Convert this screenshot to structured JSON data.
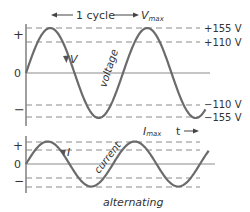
{
  "diagram": {
    "title": "alternating",
    "colors": {
      "wave": "#6b6b6b",
      "axis": "#6b6b6b",
      "dashed": "#8a8a8a",
      "text": "#333333"
    },
    "voltage_panel": {
      "cycle_label": "1 cycle",
      "vmax_label": "V",
      "vmax_subscript": "max",
      "wave_label": "voltage",
      "arrow_label": "V",
      "axis_plus": "+",
      "axis_zero": "0",
      "axis_minus": "−",
      "levels": [
        {
          "label": "+155 V",
          "value": 155
        },
        {
          "label": "+110 V",
          "value": 110
        },
        {
          "label": "−110 V",
          "value": -110
        },
        {
          "label": "−155 V",
          "value": -155
        }
      ],
      "peak": 155,
      "cycles_shown": 1.85
    },
    "current_panel": {
      "imax_label": "I",
      "imax_subscript": "max",
      "time_label": "t",
      "wave_label": "current",
      "arrow_label": "I",
      "axis_plus": "+",
      "axis_zero": "0",
      "axis_minus": "−",
      "cycles_shown": 2.1
    }
  }
}
